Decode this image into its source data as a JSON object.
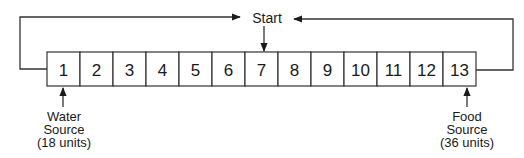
{
  "diagram": {
    "start_label": "Start",
    "cells": [
      "1",
      "2",
      "3",
      "4",
      "5",
      "6",
      "7",
      "8",
      "9",
      "10",
      "11",
      "12",
      "13"
    ],
    "start_cell_index": 6,
    "water_source": {
      "cell": "1",
      "line1": "Water",
      "line2": "Source",
      "line3": "(18 units)"
    },
    "food_source": {
      "cell": "13",
      "line1": "Food",
      "line2": "Source",
      "line3": "(36 units)"
    },
    "colors": {
      "stroke": "#333333",
      "text": "#1a1a1a",
      "background": "#ffffff"
    }
  }
}
